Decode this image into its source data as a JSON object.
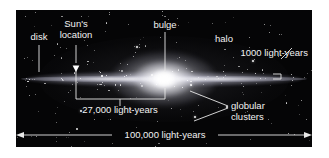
{
  "figure": {
    "panel_background": "#050506",
    "page_background": "#ffffff",
    "label_color": "#f2f2f2",
    "line_color": "#e8e8e8"
  },
  "labels": {
    "disk": "disk",
    "suns_location_line1": "Sun's",
    "suns_location_line2": "location",
    "bulge": "bulge",
    "halo": "halo",
    "thickness": "1000 light-years",
    "sun_to_center": "27,000 light-years",
    "globular_line1": "globular",
    "globular_line2": "clusters",
    "diameter": "100,000 light-years"
  },
  "chart_data": {
    "type": "diagram",
    "annotations": [
      {
        "name": "disk",
        "text": "disk",
        "kind": "component-callout"
      },
      {
        "name": "suns-location",
        "text": "Sun's location",
        "kind": "position-marker"
      },
      {
        "name": "bulge",
        "text": "bulge",
        "kind": "component-callout"
      },
      {
        "name": "halo",
        "text": "halo",
        "kind": "component-callout"
      },
      {
        "name": "globular-clusters",
        "text": "globular clusters",
        "kind": "component-callout"
      }
    ],
    "measurements": [
      {
        "name": "disk-thickness",
        "label": "1000 light-years",
        "value": 1000,
        "unit": "light-years"
      },
      {
        "name": "sun-to-galactic-center",
        "label": "27,000 light-years",
        "value": 27000,
        "unit": "light-years"
      },
      {
        "name": "galaxy-diameter",
        "label": "100,000 light-years",
        "value": 100000,
        "unit": "light-years"
      }
    ]
  }
}
